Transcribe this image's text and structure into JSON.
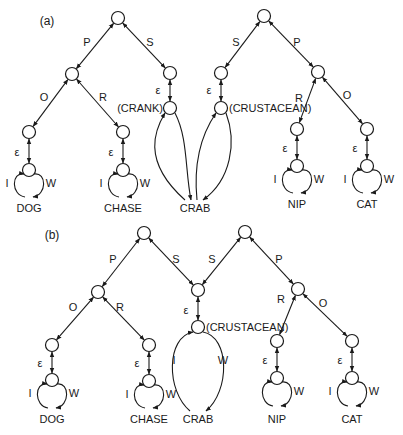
{
  "figure": {
    "colors": {
      "ink": "#1a1a1a",
      "background": "#ffffff"
    },
    "node_radius": 6.5,
    "panels": [
      {
        "id": "a",
        "label": "(a)",
        "label_pos": [
          47,
          25
        ],
        "nodes": [
          {
            "id": "a1_root",
            "x": 118,
            "y": 18
          },
          {
            "id": "a1_p",
            "x": 72,
            "y": 74
          },
          {
            "id": "a1_s",
            "x": 170,
            "y": 73
          },
          {
            "id": "a1_s_lo",
            "x": 170,
            "y": 108
          },
          {
            "id": "a1_o",
            "x": 29,
            "y": 132
          },
          {
            "id": "a1_o_lo",
            "x": 29,
            "y": 170
          },
          {
            "id": "a1_r",
            "x": 123,
            "y": 132
          },
          {
            "id": "a1_r_lo",
            "x": 123,
            "y": 170
          },
          {
            "id": "a2_root",
            "x": 264,
            "y": 16
          },
          {
            "id": "a2_s",
            "x": 221,
            "y": 73
          },
          {
            "id": "a2_s_lo",
            "x": 221,
            "y": 108
          },
          {
            "id": "a2_p",
            "x": 318,
            "y": 72
          },
          {
            "id": "a2_r",
            "x": 297,
            "y": 129
          },
          {
            "id": "a2_r_lo",
            "x": 297,
            "y": 166
          },
          {
            "id": "a2_o",
            "x": 367,
            "y": 129
          },
          {
            "id": "a2_o_lo",
            "x": 367,
            "y": 166
          }
        ],
        "edges": [
          {
            "from": "a1_root",
            "to": "a1_p",
            "label": "P",
            "lx": 87,
            "ly": 46
          },
          {
            "from": "a1_root",
            "to": "a1_s",
            "label": "S",
            "lx": 150,
            "ly": 46
          },
          {
            "from": "a1_p",
            "to": "a1_o",
            "label": "O",
            "lx": 44,
            "ly": 101
          },
          {
            "from": "a1_p",
            "to": "a1_r",
            "label": "R",
            "lx": 103,
            "ly": 101
          },
          {
            "from": "a1_o",
            "to": "a1_o_lo",
            "label": "ε",
            "lx": 17,
            "ly": 156
          },
          {
            "from": "a1_r",
            "to": "a1_r_lo",
            "label": "ε",
            "lx": 111,
            "ly": 156
          },
          {
            "from": "a1_s",
            "to": "a1_s_lo",
            "label": "ε",
            "lx": 158,
            "ly": 94
          },
          {
            "from": "a2_root",
            "to": "a2_s",
            "label": "S",
            "lx": 236,
            "ly": 46
          },
          {
            "from": "a2_root",
            "to": "a2_p",
            "label": "P",
            "lx": 297,
            "ly": 46
          },
          {
            "from": "a2_s",
            "to": "a2_s_lo",
            "label": "ε",
            "lx": 209,
            "ly": 94
          },
          {
            "from": "a2_p",
            "to": "a2_r",
            "label": "R",
            "lx": 299,
            "ly": 102
          },
          {
            "from": "a2_p",
            "to": "a2_o",
            "label": "O",
            "lx": 347,
            "ly": 99
          },
          {
            "from": "a2_r",
            "to": "a2_r_lo",
            "label": "ε",
            "lx": 285,
            "ly": 152
          },
          {
            "from": "a2_o",
            "to": "a2_o_lo",
            "label": "ε",
            "lx": 355,
            "ly": 152
          }
        ],
        "loops": [
          {
            "node": "a1_o_lo",
            "word": "DOG",
            "wx": 29,
            "wy": 212,
            "left": "I",
            "right": "W",
            "bottom": 197,
            "half": 14
          },
          {
            "node": "a1_r_lo",
            "word": "CHASE",
            "wx": 123,
            "wy": 212,
            "left": "I",
            "right": "W",
            "bottom": 197,
            "half": 14
          },
          {
            "node": "a2_r_lo",
            "word": "NIP",
            "wx": 297,
            "wy": 208,
            "left": "I",
            "right": "W",
            "bottom": 193,
            "half": 14
          },
          {
            "node": "a2_o_lo",
            "word": "CAT",
            "wx": 367,
            "wy": 208,
            "left": "I",
            "right": "W",
            "bottom": 193,
            "half": 14
          }
        ],
        "long_loops": [
          {
            "node": "a1_s_lo",
            "word_anchor": "crab_a",
            "tag": "(CRANK)",
            "tag_x": 163,
            "tag_y": 112,
            "tag_anchor": "end",
            "side": "left"
          },
          {
            "node": "a2_s_lo",
            "word_anchor": "crab_a",
            "tag": "(CRUSTACEAN)",
            "tag_x": 229,
            "tag_y": 112,
            "tag_anchor": "start",
            "side": "right"
          }
        ],
        "shared_words": [
          {
            "id": "crab_a",
            "text": "CRAB",
            "x": 195,
            "y": 212
          }
        ]
      },
      {
        "id": "b",
        "label": "(b)",
        "label_pos": [
          52,
          239
        ],
        "nodes": [
          {
            "id": "b1_root",
            "x": 144,
            "y": 233
          },
          {
            "id": "b1_p",
            "x": 98,
            "y": 292
          },
          {
            "id": "bs",
            "x": 198,
            "y": 290
          },
          {
            "id": "bs_lo",
            "x": 198,
            "y": 327
          },
          {
            "id": "b1_o",
            "x": 52,
            "y": 345
          },
          {
            "id": "b1_o_lo",
            "x": 52,
            "y": 380
          },
          {
            "id": "b1_r",
            "x": 149,
            "y": 345
          },
          {
            "id": "b1_r_lo",
            "x": 149,
            "y": 381
          },
          {
            "id": "b2_root",
            "x": 245,
            "y": 232
          },
          {
            "id": "b2_p",
            "x": 298,
            "y": 289
          },
          {
            "id": "b2_r",
            "x": 277,
            "y": 341
          },
          {
            "id": "b2_r_lo",
            "x": 277,
            "y": 378
          },
          {
            "id": "b2_o",
            "x": 352,
            "y": 341
          },
          {
            "id": "b2_o_lo",
            "x": 352,
            "y": 378
          }
        ],
        "edges": [
          {
            "from": "b1_root",
            "to": "b1_p",
            "label": "P",
            "lx": 113,
            "ly": 263
          },
          {
            "from": "b1_root",
            "to": "bs",
            "label": "S",
            "lx": 176,
            "ly": 263
          },
          {
            "from": "b2_root",
            "to": "bs",
            "label": "S",
            "lx": 212,
            "ly": 263
          },
          {
            "from": "b2_root",
            "to": "b2_p",
            "label": "P",
            "lx": 279,
            "ly": 263
          },
          {
            "from": "b1_p",
            "to": "b1_o",
            "label": "O",
            "lx": 73,
            "ly": 311
          },
          {
            "from": "b1_p",
            "to": "b1_r",
            "label": "R",
            "lx": 120,
            "ly": 311
          },
          {
            "from": "b1_o",
            "to": "b1_o_lo",
            "label": "ε",
            "lx": 40,
            "ly": 367
          },
          {
            "from": "b1_r",
            "to": "b1_r_lo",
            "label": "ε",
            "lx": 137,
            "ly": 367
          },
          {
            "from": "bs",
            "to": "bs_lo",
            "label": "ε",
            "lx": 186,
            "ly": 314
          },
          {
            "from": "b2_p",
            "to": "b2_r",
            "label": "R",
            "lx": 281,
            "ly": 303
          },
          {
            "from": "b2_p",
            "to": "b2_o",
            "label": "O",
            "lx": 323,
            "ly": 307
          },
          {
            "from": "b2_r",
            "to": "b2_r_lo",
            "label": "ε",
            "lx": 265,
            "ly": 364
          },
          {
            "from": "b2_o",
            "to": "b2_o_lo",
            "label": "ε",
            "lx": 340,
            "ly": 364
          }
        ],
        "loops": [
          {
            "node": "b1_o_lo",
            "word": "DOG",
            "wx": 52,
            "wy": 423,
            "left": "I",
            "right": "W",
            "bottom": 408,
            "half": 14
          },
          {
            "node": "b1_r_lo",
            "word": "CHASE",
            "wx": 149,
            "wy": 423,
            "left": "I",
            "right": "W",
            "bottom": 408,
            "half": 14
          },
          {
            "node": "b2_r_lo",
            "word": "NIP",
            "wx": 277,
            "wy": 423,
            "left": "",
            "right": "W",
            "bottom": 406,
            "half": 14
          },
          {
            "node": "b2_o_lo",
            "word": "CAT",
            "wx": 352,
            "wy": 423,
            "left": "I",
            "right": "W",
            "bottom": 406,
            "half": 14
          }
        ],
        "big_loop": {
          "node": "bs_lo",
          "word": "CRAB",
          "wx": 198,
          "wy": 423,
          "left": "I",
          "right": "W",
          "lx": 174,
          "ly": 364,
          "rx": 223,
          "ry": 364,
          "tag": "(CRUSTACEAN)",
          "tag_x": 206,
          "tag_y": 331
        }
      }
    ]
  }
}
